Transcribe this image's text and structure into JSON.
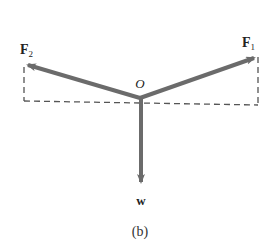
{
  "diagram": {
    "type": "free-body force diagram",
    "caption": "(b)",
    "origin": {
      "label": "O",
      "x": 140,
      "y": 98
    },
    "colors": {
      "arrow": "#6b6b6b",
      "dashed": "#555555",
      "text": "#222222",
      "background": "#ffffff"
    },
    "vectors": [
      {
        "id": "F1",
        "label_main": "F",
        "label_sub": "1",
        "tip": {
          "x": 258,
          "y": 57
        },
        "label_pos": {
          "x": 242,
          "y": 47
        }
      },
      {
        "id": "F2",
        "label_main": "F",
        "label_sub": "2",
        "tip": {
          "x": 24,
          "y": 64
        },
        "label_pos": {
          "x": 20,
          "y": 54
        }
      },
      {
        "id": "w",
        "label_main": "w",
        "label_sub": "",
        "tip": {
          "x": 141,
          "y": 186
        },
        "label_pos": {
          "x": 141,
          "y": 205
        }
      }
    ],
    "dashed_box": {
      "left_top": {
        "x": 24,
        "y": 67
      },
      "left_bottom": {
        "x": 24,
        "y": 101
      },
      "right_bottom": {
        "x": 258,
        "y": 105
      },
      "right_top": {
        "x": 258,
        "y": 57
      }
    }
  }
}
